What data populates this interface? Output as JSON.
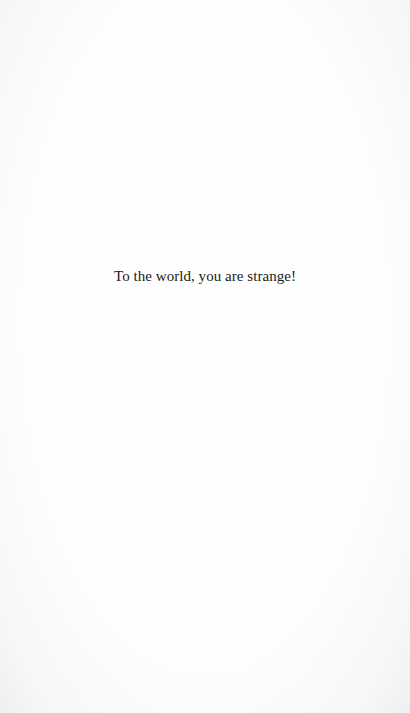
{
  "page": {
    "body_text": "To the world, you are strange!"
  }
}
